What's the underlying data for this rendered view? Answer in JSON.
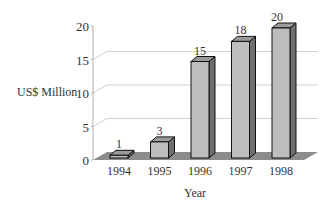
{
  "chart_data": {
    "type": "bar",
    "title": "",
    "xlabel": "Year",
    "ylabel": "US$ Million",
    "categories": [
      "1994",
      "1995",
      "1996",
      "1997",
      "1998"
    ],
    "values": [
      1,
      3,
      15,
      18,
      20
    ],
    "data_labels": [
      "1",
      "3",
      "15",
      "18",
      "20"
    ],
    "yticks": [
      "0",
      "5",
      "10",
      "15",
      "20"
    ],
    "ylim": [
      0,
      20
    ],
    "grid": true,
    "style": "3d-column",
    "colors": {
      "bar_front": "#bdbdbd",
      "bar_side": "#6e6e6e",
      "bar_top": "#9a9a9a",
      "floor": "#8c8c8c",
      "grid": "#d0d0d0",
      "axis": "#b0b0b0"
    }
  }
}
